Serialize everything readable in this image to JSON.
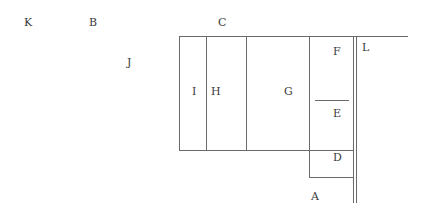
{
  "diagram": {
    "labels": {
      "K": "K",
      "B": "B",
      "C": "C",
      "J": "J",
      "I": "I",
      "H": "H",
      "G": "G",
      "F": "F",
      "E": "E",
      "D": "D",
      "L": "L",
      "A": "A"
    },
    "line_color": "#6a6a6a",
    "background": "#ffffff"
  }
}
